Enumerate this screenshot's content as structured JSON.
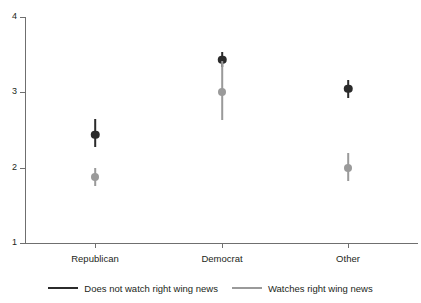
{
  "chart_data": {
    "type": "scatter",
    "title": "",
    "subtitle": "",
    "xlabel": "",
    "ylabel": "",
    "categories": [
      "Republican",
      "Democrat",
      "Other"
    ],
    "ylim": [
      1,
      4
    ],
    "yticks": [
      1,
      2,
      3,
      4
    ],
    "ytick_labels": [
      "1",
      "2",
      "3",
      "4"
    ],
    "grid": false,
    "legend_position": "bottom",
    "series": [
      {
        "name": "Does not watch right wing news",
        "color": "#2b2b2b",
        "values": [
          2.44,
          3.43,
          3.05
        ],
        "ci_low": [
          2.28,
          3.33,
          2.93
        ],
        "ci_high": [
          2.64,
          3.53,
          3.17
        ]
      },
      {
        "name": "Watches right wing news",
        "color": "#9a9a9a",
        "values": [
          1.87,
          3.01,
          2.0
        ],
        "ci_low": [
          1.76,
          2.63,
          1.82
        ],
        "ci_high": [
          2.0,
          3.41,
          2.2
        ]
      }
    ]
  },
  "legend": {
    "entries": [
      {
        "label": "Does not watch right wing news",
        "color": "#2b2b2b"
      },
      {
        "label": "Watches right wing news",
        "color": "#9a9a9a"
      }
    ]
  },
  "axis": {
    "y_tick_labels": [
      "4",
      "3",
      "2",
      "1"
    ],
    "x_tick_labels": [
      "Republican",
      "Democrat",
      "Other"
    ]
  },
  "colors": {
    "axis": "#6f6f6f",
    "text": "#231f20",
    "series_dark": "#2b2b2b",
    "series_light": "#9a9a9a",
    "background": "#ffffff"
  }
}
